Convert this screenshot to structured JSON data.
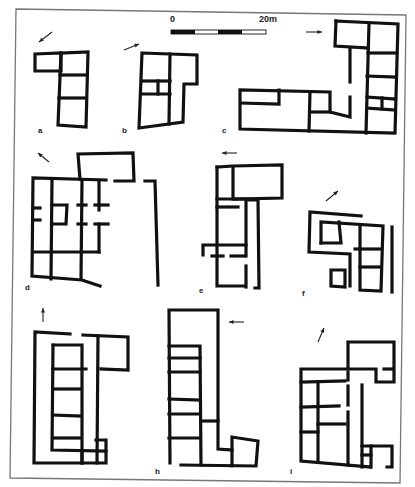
{
  "figure": {
    "frame": [
      [
        16,
        9
      ],
      [
        406,
        15
      ],
      [
        400,
        483
      ],
      [
        10,
        478
      ]
    ],
    "scale_bar": {
      "label_start": "0",
      "label_end": "20m",
      "x": 171,
      "y": 30,
      "width": 95,
      "height": 4,
      "segments": [
        {
          "x": 171,
          "w": 12,
          "fill": "black"
        },
        {
          "x": 183,
          "w": 12,
          "fill": "black"
        },
        {
          "x": 195,
          "w": 23,
          "fill": "white"
        },
        {
          "x": 218,
          "w": 24,
          "fill": "black"
        },
        {
          "x": 242,
          "w": 24,
          "fill": "white"
        }
      ],
      "label_start_pos": [
        170,
        22
      ],
      "label_end_pos": [
        259,
        22
      ]
    },
    "plans": [
      {
        "id": "a",
        "label": "a",
        "label_pos": [
          38,
          133
        ],
        "arrow": {
          "from": [
            52,
            32
          ],
          "to": [
            39,
            42
          ]
        },
        "walls": [
          "M35,54 L61,53 L61,71 L35,71 Z",
          "M61,53 L88,52 L86,127 L58,125 L61,53",
          "M60,75 L87,75",
          "M59,98 L86,98"
        ]
      },
      {
        "id": "b",
        "label": "b",
        "label_pos": [
          122,
          133
        ],
        "arrow": {
          "from": [
            124,
            50
          ],
          "to": [
            139,
            44
          ]
        },
        "walls": [
          "M142,53 L197,55 L197,84 L184,84 L183,122 L139,128 Z",
          "M170,54 L169,124",
          "M142,81 L170,81",
          "M141,94 L170,94",
          "M158,81 L158,94"
        ]
      },
      {
        "id": "c",
        "label": "c",
        "label_pos": [
          222,
          133
        ],
        "arrow": {
          "from": [
            306,
            32
          ],
          "to": [
            322,
            32
          ]
        },
        "walls": [
          "M336,21 L398,24 L395,133 L240,129 L240,90 L330,92 L330,112 L350,117 L350,97",
          "M336,21 L335,46 L368,48",
          "M369,24 L366,133",
          "M368,53 L396,53",
          "M367,76 L396,77",
          "M367,97 L395,99",
          "M367,108 L395,110",
          "M382,98 L382,109",
          "M241,103 L279,104 L279,90",
          "M310,92 L309,131",
          "M310,112 L330,112",
          "M350,48 L350,82"
        ]
      },
      {
        "id": "d",
        "label": "d",
        "label_pos": [
          25,
          290
        ],
        "arrow": {
          "from": [
            49,
            162
          ],
          "to": [
            38,
            153
          ]
        },
        "walls": [
          "M80,179 L78,154 L133,153 L134,181 L115,181",
          "M106,180 L33,178 L32,276 L82,280 L100,286",
          "M52,179 L51,279",
          "M82,180 L81,279",
          "M99,181 L99,210",
          "M33,252 L99,252",
          "M33,208 L40,208",
          "M33,220 L40,220",
          "M52,205 L67,205 L66,224 L52,224",
          "M78,205 L86,205",
          "M95,205 L108,205",
          "M78,224 L86,224",
          "M95,224 L108,224",
          "M99,224 L99,252",
          "M145,181 L155,181 L158,285"
        ]
      },
      {
        "id": "e",
        "label": "e",
        "label_pos": [
          199,
          293
        ],
        "arrow": {
          "from": [
            237,
            153
          ],
          "to": [
            222,
            153
          ]
        },
        "walls": [
          "M217,167 L233,166 L282,165 L282,198 L235,199",
          "M217,167 L217,286 L244,286",
          "M233,167 L233,199",
          "M217,199 L247,199",
          "M217,207 L238,207",
          "M246,200 L246,256",
          "M246,266 L246,287",
          "M249,200 L258,200 L259,288 L255,288",
          "M203,255 L203,245 L246,245",
          "M212,256 L223,256",
          "M231,256 L244,256"
        ]
      },
      {
        "id": "f",
        "label": "f",
        "label_pos": [
          302,
          296
        ],
        "arrow": {
          "from": [
            326,
            201
          ],
          "to": [
            338,
            191
          ]
        },
        "walls": [
          "M361,216 L310,212 L309,252 L350,254 L350,286",
          "M321,243 L321,222 L383,226 L381,291 L360,290 L360,226",
          "M321,243 L341,243 L339,222",
          "M355,249 L381,249",
          "M360,267 L381,267",
          "M331,270 L345,270 L345,287 L331,286 Z",
          "M392,227 L392,292"
        ]
      },
      {
        "id": "g",
        "label": "",
        "label_pos": [
          0,
          0
        ],
        "arrow": {
          "from": [
            43,
            322
          ],
          "to": [
            43,
            308
          ]
        },
        "walls": [
          "M70,334 L35,332 L34,463 L106,463 L106,440 L96,440",
          "M83,335 L128,337 L128,370 L101,369",
          "M98,336 L97,463",
          "M53,345 L82,345 L82,463",
          "M53,345 L52,450 L106,451",
          "M53,369 L86,369",
          "M53,389 L81,389",
          "M53,415 L81,416",
          "M53,438 L81,438",
          "M82,451 L82,463"
        ]
      },
      {
        "id": "h",
        "label": "h",
        "label_pos": [
          155,
          474
        ],
        "arrow": {
          "from": [
            244,
            322
          ],
          "to": [
            229,
            322
          ]
        },
        "walls": [
          "M170,463 L169,310 L218,310 L218,449 L232,450",
          "M169,346 L200,346 L201,465",
          "M169,358 L200,358",
          "M169,372 L200,372",
          "M169,399 L200,400",
          "M169,414 L200,414",
          "M169,438 L200,438",
          "M201,421 L218,421",
          "M181,465 L256,466 L258,441 L232,437 L232,466"
        ]
      },
      {
        "id": "i",
        "label": "i",
        "label_pos": [
          290,
          474
        ],
        "arrow": {
          "from": [
            318,
            342
          ],
          "to": [
            324,
            328
          ]
        },
        "walls": [
          "M348,368 L348,342 L394,342 L394,382 L376,382 L376,369 L301,369 L301,461 L370,467",
          "M301,382 L345,381",
          "M384,369 L393,369",
          "M318,382 L318,460",
          "M301,407 L339,406",
          "M318,424 L345,424",
          "M301,432 L318,432",
          "M348,372 L348,380",
          "M348,386 L348,405",
          "M348,412 L348,465",
          "M362,385 L362,467",
          "M362,446 L392,446 L392,467 L387,467",
          "M362,455 L371,455",
          "M371,446 L371,467"
        ]
      }
    ]
  }
}
